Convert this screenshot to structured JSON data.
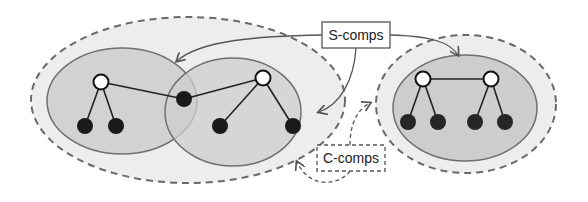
{
  "diagram": {
    "labels": {
      "s_comps": "S-comps",
      "c_comps": "C-comps"
    },
    "colors": {
      "outer_fill": "#ececec",
      "inner_fill": "#cfcfcf",
      "inner_stroke": "#707070",
      "dash_stroke": "#6a6a6a",
      "node_black": "#1a1a1a",
      "node_white": "#ffffff",
      "edge": "#222222"
    },
    "components": [
      {
        "id": "c-comp-left",
        "type": "C-comp",
        "contains": [
          "s-comp-1",
          "s-comp-2"
        ]
      },
      {
        "id": "c-comp-right",
        "type": "C-comp",
        "contains": [
          "s-comp-3"
        ]
      }
    ]
  }
}
